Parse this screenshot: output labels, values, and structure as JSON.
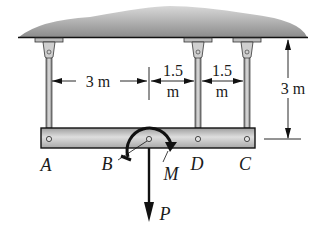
{
  "diagram": {
    "type": "statics-beam-hanger",
    "colors": {
      "ceiling_dark": "#7a7a7a",
      "ceiling_light": "#e6e6e6",
      "beam_fill": "#c8c8c8",
      "line": "#111111",
      "rod": "#9a9a9a"
    },
    "points": {
      "A": "A",
      "B": "B",
      "D": "D",
      "C": "C"
    },
    "loads": {
      "force": "P",
      "moment": "M"
    },
    "dimensions": {
      "a_to_b": "3 m",
      "b_to_d_top": "1.5",
      "b_to_d_bottom": "m",
      "d_to_c_top": "1.5",
      "d_to_c_bottom": "m",
      "height": "3 m"
    }
  }
}
